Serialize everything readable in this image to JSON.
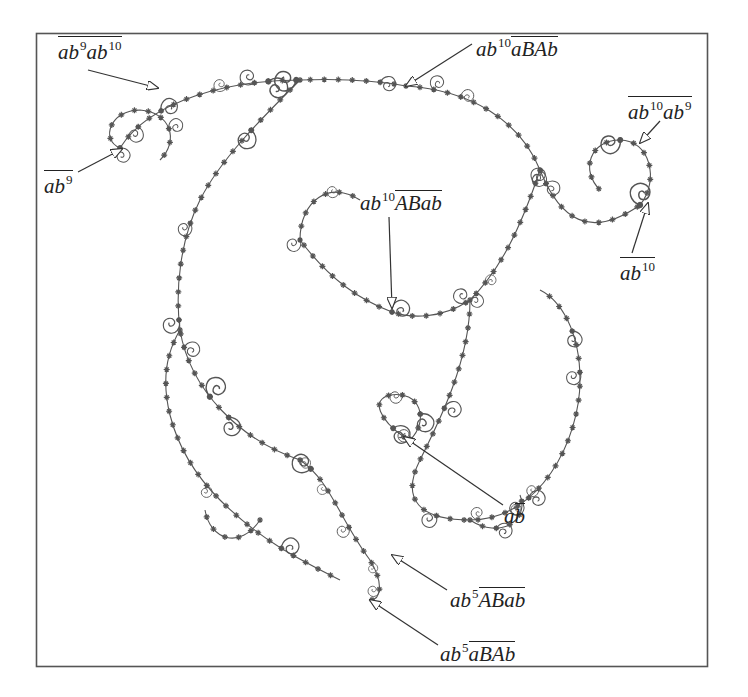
{
  "figure": {
    "frame": {
      "x": 36,
      "y": 33,
      "width": 672,
      "height": 634,
      "color": "#555555"
    },
    "ink_color": "#555555",
    "labels": [
      {
        "id": "ab9ab10",
        "text": "ab9ab10",
        "parts": [
          {
            "t": "ab",
            "sup": "9"
          },
          {
            "t": "ab",
            "sup": "10"
          }
        ],
        "overline": "all",
        "x": 58,
        "y": 36,
        "arrow_from": [
          88,
          70
        ],
        "arrow_to": [
          158,
          88
        ]
      },
      {
        "id": "ab9",
        "text": "ab9",
        "parts": [
          {
            "t": "ab",
            "sup": "9"
          }
        ],
        "overline": "all",
        "x": 44,
        "y": 170,
        "arrow_from": [
          78,
          172
        ],
        "arrow_to": [
          122,
          149
        ]
      },
      {
        "id": "ab10aBAb",
        "text": "ab10 aBAb",
        "prefix": {
          "t": "ab",
          "sup": "10"
        },
        "overlined": "aBAb",
        "x": 476,
        "y": 36,
        "arrow_from": [
          472,
          44
        ],
        "arrow_to": [
          406,
          86
        ]
      },
      {
        "id": "ab10ab9",
        "text": "ab10ab9",
        "parts": [
          {
            "t": "ab",
            "sup": "10"
          },
          {
            "t": "ab",
            "sup": "9"
          }
        ],
        "overline": "all",
        "x": 628,
        "y": 96,
        "arrow_from": [
          660,
          121
        ],
        "arrow_to": [
          640,
          143
        ]
      },
      {
        "id": "ab10",
        "text": "ab10",
        "parts": [
          {
            "t": "ab",
            "sup": "10"
          }
        ],
        "overline": "all",
        "x": 620,
        "y": 257,
        "arrow_from": [
          632,
          253
        ],
        "arrow_to": [
          648,
          203
        ]
      },
      {
        "id": "ab10ABab",
        "text": "ab10 ABab",
        "prefix": {
          "t": "ab",
          "sup": "10"
        },
        "overlined": "ABab",
        "x": 360,
        "y": 190,
        "arrow_from": [
          389,
          217
        ],
        "arrow_to": [
          392,
          308
        ]
      },
      {
        "id": "ab-bar",
        "text": "ab̄",
        "prefix": {
          "t": "a"
        },
        "overlined": "b",
        "x": 504,
        "y": 503,
        "arrow_from": [
          503,
          505
        ],
        "arrow_to": [
          404,
          437
        ]
      },
      {
        "id": "ab5ABab",
        "text": "ab5 ABab",
        "prefix": {
          "t": "ab",
          "sup": "5"
        },
        "overlined": "ABab",
        "x": 450,
        "y": 587,
        "arrow_from": [
          447,
          590
        ],
        "arrow_to": [
          392,
          555
        ]
      },
      {
        "id": "ab5aBAb",
        "text": "ab5 aBAb",
        "prefix": {
          "t": "ab",
          "sup": "5"
        },
        "overlined": "aBAb",
        "x": 440,
        "y": 641,
        "arrow_from": [
          438,
          645
        ],
        "arrow_to": [
          370,
          600
        ]
      }
    ]
  }
}
